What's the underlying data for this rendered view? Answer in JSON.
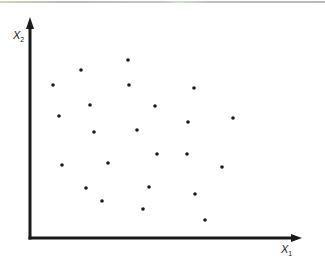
{
  "chart_data": {
    "type": "scatter",
    "title": "",
    "xlabel": "X1",
    "ylabel": "X2",
    "xlabel_display": {
      "base": "X",
      "sub": "1"
    },
    "ylabel_display": {
      "base": "X",
      "sub": "2"
    },
    "ticks": "none",
    "grid": false,
    "legend": null,
    "xlim": [
      0,
      272
    ],
    "ylim": [
      0,
      221
    ],
    "units_note": "arbitrary (pixel-relative from origin)",
    "series": [
      {
        "name": "points",
        "color": "#1a1a1a",
        "points": [
          {
            "x": 23,
            "y": 153
          },
          {
            "x": 51,
            "y": 168
          },
          {
            "x": 98,
            "y": 178
          },
          {
            "x": 99,
            "y": 153
          },
          {
            "x": 29,
            "y": 122
          },
          {
            "x": 60,
            "y": 133
          },
          {
            "x": 64,
            "y": 106
          },
          {
            "x": 107,
            "y": 108
          },
          {
            "x": 125,
            "y": 132
          },
          {
            "x": 164,
            "y": 150
          },
          {
            "x": 158,
            "y": 116
          },
          {
            "x": 203,
            "y": 120
          },
          {
            "x": 32,
            "y": 73
          },
          {
            "x": 78,
            "y": 75
          },
          {
            "x": 127,
            "y": 84
          },
          {
            "x": 157,
            "y": 84
          },
          {
            "x": 192,
            "y": 71
          },
          {
            "x": 56,
            "y": 50
          },
          {
            "x": 119,
            "y": 51
          },
          {
            "x": 165,
            "y": 44
          },
          {
            "x": 72,
            "y": 37
          },
          {
            "x": 113,
            "y": 29
          },
          {
            "x": 175,
            "y": 18
          }
        ]
      }
    ]
  },
  "layout": {
    "origin_px": {
      "x": 30,
      "y": 238
    },
    "x_axis_end_px": 302,
    "y_axis_end_px": 17,
    "axis_color": "#1a1a1a"
  }
}
